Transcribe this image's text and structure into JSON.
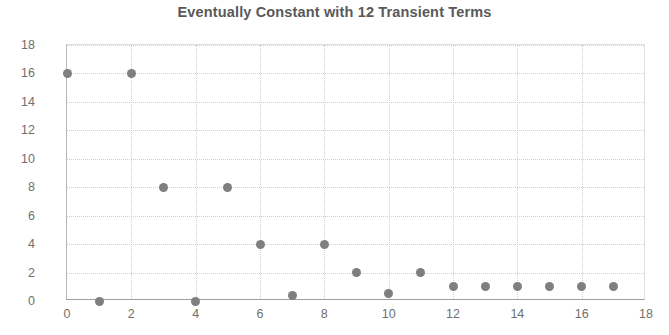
{
  "chart_data": {
    "type": "scatter",
    "title": "Eventually Constant with 12 Transient Terms",
    "xlabel": "",
    "ylabel": "",
    "xlim": [
      0,
      18
    ],
    "ylim": [
      0,
      18
    ],
    "xticks": [
      0,
      2,
      4,
      6,
      8,
      10,
      12,
      14,
      16,
      18
    ],
    "yticks": [
      0,
      2,
      4,
      6,
      8,
      10,
      12,
      14,
      16,
      18
    ],
    "xtick_labels": [
      "0",
      "2",
      "4",
      "6",
      "8",
      "10",
      "12",
      "14",
      "16",
      "18"
    ],
    "ytick_labels": [
      "0",
      "2",
      "4",
      "6",
      "8",
      "10",
      "12",
      "14",
      "16",
      "18"
    ],
    "grid": true,
    "legend": false,
    "marker_color": "#7f7f7f",
    "title_color": "#595959",
    "tick_color": "#6f6f6f",
    "grid_color": "#cfcfcf",
    "x": [
      0,
      1,
      2,
      3,
      4,
      5,
      6,
      7,
      8,
      9,
      10,
      11,
      12,
      13,
      14,
      15,
      16,
      17
    ],
    "y": [
      16,
      0,
      16,
      8,
      0,
      8,
      4,
      0.4,
      4,
      2,
      0.55,
      2,
      1,
      1,
      1,
      1,
      1,
      1
    ],
    "series": [
      {
        "name": "sequence",
        "points": [
          {
            "x": 0,
            "y": 16
          },
          {
            "x": 1,
            "y": 0
          },
          {
            "x": 2,
            "y": 16
          },
          {
            "x": 3,
            "y": 8
          },
          {
            "x": 4,
            "y": 0
          },
          {
            "x": 5,
            "y": 8
          },
          {
            "x": 6,
            "y": 4
          },
          {
            "x": 7,
            "y": 0.4
          },
          {
            "x": 8,
            "y": 4
          },
          {
            "x": 9,
            "y": 2
          },
          {
            "x": 10,
            "y": 0.55
          },
          {
            "x": 11,
            "y": 2
          },
          {
            "x": 12,
            "y": 1
          },
          {
            "x": 13,
            "y": 1
          },
          {
            "x": 14,
            "y": 1
          },
          {
            "x": 15,
            "y": 1
          },
          {
            "x": 16,
            "y": 1
          },
          {
            "x": 17,
            "y": 1
          }
        ]
      }
    ]
  }
}
